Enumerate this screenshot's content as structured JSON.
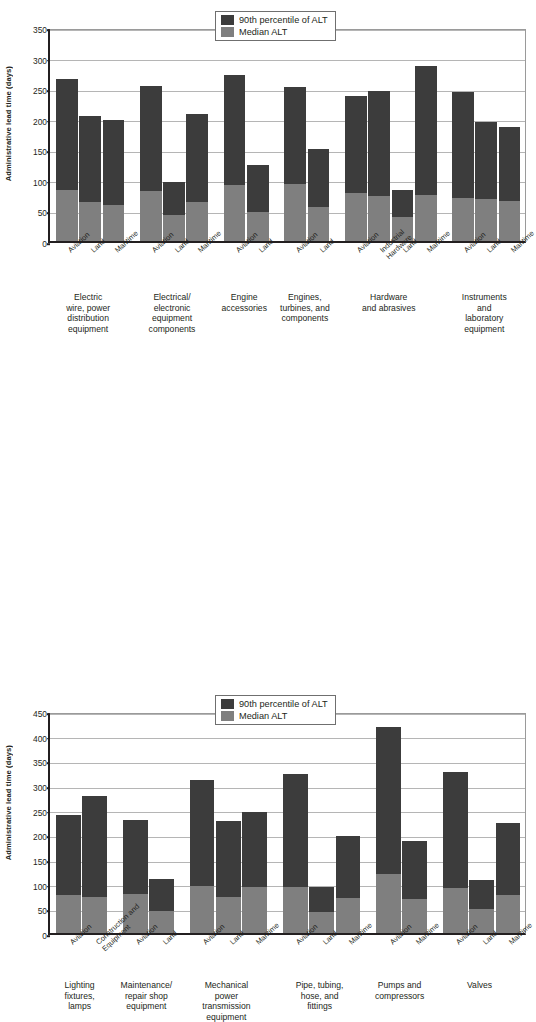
{
  "chart_data": [
    {
      "type": "bar",
      "title": "",
      "xlabel": "",
      "ylabel": "Administrative lead time (days)",
      "ylim": [
        0,
        350
      ],
      "ytick_step": 50,
      "yticks": [
        "0",
        "50",
        "100",
        "150",
        "200",
        "250",
        "300",
        "350"
      ],
      "grid": true,
      "legend_position": "top-center",
      "legend": [
        "90th percentile of ALT",
        "Median ALT"
      ],
      "series": [
        {
          "name": "90th percentile of ALT",
          "color": "#3c3c3c"
        },
        {
          "name": "Median ALT",
          "color": "#7f7f7f"
        }
      ],
      "groups": [
        {
          "caption": "Electric wire, power distribution equipment",
          "caption_lines": [
            "Electric",
            "wire, power",
            "distribution",
            "equipment"
          ],
          "bars": [
            {
              "label": "Aviation",
              "p90": 265,
              "median": 84
            },
            {
              "label": "Land",
              "p90": 204,
              "median": 64
            },
            {
              "label": "Maritime",
              "p90": 198,
              "median": 59
            }
          ]
        },
        {
          "caption": "Electrical/electronic equipment components",
          "caption_lines": [
            "Electrical/",
            "electronic",
            "equipment",
            "components"
          ],
          "bars": [
            {
              "label": "Aviation",
              "p90": 254,
              "median": 81
            },
            {
              "label": "Land",
              "p90": 96,
              "median": 43
            },
            {
              "label": "Maritime",
              "p90": 207,
              "median": 64
            }
          ]
        },
        {
          "caption": "Engine accessories",
          "caption_lines": [
            "Engine",
            "accessories"
          ],
          "bars": [
            {
              "label": "Aviation",
              "p90": 271,
              "median": 91
            },
            {
              "label": "Land",
              "p90": 125,
              "median": 48
            }
          ]
        },
        {
          "caption": "Engines, turbines, and components",
          "caption_lines": [
            "Engines,",
            "turbines, and",
            "components"
          ],
          "bars": [
            {
              "label": "Aviation",
              "p90": 252,
              "median": 93
            },
            {
              "label": "Land",
              "p90": 150,
              "median": 56
            }
          ]
        },
        {
          "caption": "Hardware and abrasives",
          "caption_lines": [
            "Hardware",
            "and abrasives"
          ],
          "bars": [
            {
              "label": "Aviation",
              "p90": 237,
              "median": 78
            },
            {
              "label": "Industrial Hardware",
              "label_lines": [
                "Industrial",
                "Hardware"
              ],
              "p90": 246,
              "median": 74
            },
            {
              "label": "Land",
              "p90": 83,
              "median": 40
            },
            {
              "label": "Maritime",
              "p90": 286,
              "median": 75
            }
          ]
        },
        {
          "caption": "Instruments and laboratory equipment",
          "caption_lines": [
            "Instruments",
            "and",
            "laboratory",
            "equipment"
          ],
          "bars": [
            {
              "label": "Aviation",
              "p90": 243,
              "median": 70
            },
            {
              "label": "Land",
              "p90": 194,
              "median": 68
            },
            {
              "label": "Maritime",
              "p90": 187,
              "median": 65
            }
          ]
        }
      ]
    },
    {
      "type": "bar",
      "title": "",
      "xlabel": "",
      "ylabel": "Administrative lead time (days)",
      "ylim": [
        0,
        450
      ],
      "ytick_step": 50,
      "yticks": [
        "0",
        "50",
        "100",
        "150",
        "200",
        "250",
        "300",
        "350",
        "400",
        "450"
      ],
      "grid": true,
      "legend_position": "top-center",
      "legend": [
        "90th percentile of ALT",
        "Median ALT"
      ],
      "series": [
        {
          "name": "90th percentile of ALT",
          "color": "#3c3c3c"
        },
        {
          "name": "Median ALT",
          "color": "#7f7f7f"
        }
      ],
      "groups": [
        {
          "caption": "Lighting fixtures, lamps",
          "caption_lines": [
            "Lighting",
            "fixtures,",
            "lamps"
          ],
          "bars": [
            {
              "label": "Aviation",
              "p90": 240,
              "median": 78
            },
            {
              "label": "Construction and Equipment",
              "label_lines": [
                "Construction and",
                "Equipment"
              ],
              "p90": 278,
              "median": 74
            }
          ]
        },
        {
          "caption": "Maintenance/repair shop equipment",
          "caption_lines": [
            "Maintenance/",
            "repair shop",
            "equipment"
          ],
          "bars": [
            {
              "label": "Aviation",
              "p90": 230,
              "median": 79
            },
            {
              "label": "Land",
              "p90": 110,
              "median": 45
            }
          ]
        },
        {
          "caption": "Mechanical power transmission equipment",
          "caption_lines": [
            "Mechanical",
            "power",
            "transmission",
            "equipment"
          ],
          "bars": [
            {
              "label": "Aviation",
              "p90": 310,
              "median": 95
            },
            {
              "label": "Land",
              "p90": 228,
              "median": 72
            },
            {
              "label": "Maritime",
              "p90": 245,
              "median": 93
            }
          ]
        },
        {
          "caption": "Pipe, tubing, hose, and fittings",
          "caption_lines": [
            "Pipe, tubing,",
            "hose, and",
            "fittings"
          ],
          "bars": [
            {
              "label": "Aviation",
              "p90": 322,
              "median": 93
            },
            {
              "label": "Land",
              "p90": 93,
              "median": 42
            },
            {
              "label": "Maritime",
              "p90": 196,
              "median": 71
            }
          ]
        },
        {
          "caption": "Pumps and compressors",
          "caption_lines": [
            "Pumps and",
            "compressors"
          ],
          "bars": [
            {
              "label": "Aviation",
              "p90": 417,
              "median": 119
            },
            {
              "label": "Maritime",
              "p90": 187,
              "median": 68
            }
          ]
        },
        {
          "caption": "Valves",
          "caption_lines": [
            "Valves"
          ],
          "bars": [
            {
              "label": "Aviation",
              "p90": 327,
              "median": 92
            },
            {
              "label": "Land",
              "p90": 108,
              "median": 49
            },
            {
              "label": "Maritime",
              "p90": 224,
              "median": 78
            }
          ]
        }
      ]
    }
  ]
}
